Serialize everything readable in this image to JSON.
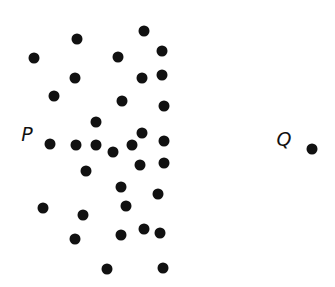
{
  "labels": [
    {
      "id": "P",
      "text": "P",
      "x": 27,
      "y": 134
    },
    {
      "id": "Q",
      "text": "Q",
      "x": 284,
      "y": 139
    }
  ],
  "points": [
    {
      "x": 144,
      "y": 31
    },
    {
      "x": 77,
      "y": 39
    },
    {
      "x": 162,
      "y": 51
    },
    {
      "x": 118,
      "y": 57
    },
    {
      "x": 34,
      "y": 58
    },
    {
      "x": 162,
      "y": 75
    },
    {
      "x": 75,
      "y": 78
    },
    {
      "x": 142,
      "y": 78
    },
    {
      "x": 54,
      "y": 96
    },
    {
      "x": 122,
      "y": 101
    },
    {
      "x": 164,
      "y": 106
    },
    {
      "x": 96,
      "y": 122
    },
    {
      "x": 142,
      "y": 133
    },
    {
      "x": 164,
      "y": 141
    },
    {
      "x": 50,
      "y": 144
    },
    {
      "x": 76,
      "y": 145
    },
    {
      "x": 96,
      "y": 145
    },
    {
      "x": 132,
      "y": 145
    },
    {
      "x": 113,
      "y": 152
    },
    {
      "x": 140,
      "y": 165
    },
    {
      "x": 164,
      "y": 163
    },
    {
      "x": 86,
      "y": 171
    },
    {
      "x": 121,
      "y": 187
    },
    {
      "x": 158,
      "y": 194
    },
    {
      "x": 126,
      "y": 206
    },
    {
      "x": 43,
      "y": 208
    },
    {
      "x": 83,
      "y": 215
    },
    {
      "x": 144,
      "y": 229
    },
    {
      "x": 160,
      "y": 233
    },
    {
      "x": 121,
      "y": 235
    },
    {
      "x": 75,
      "y": 239
    },
    {
      "x": 163,
      "y": 268
    },
    {
      "x": 107,
      "y": 269
    },
    {
      "x": 312,
      "y": 149
    }
  ]
}
